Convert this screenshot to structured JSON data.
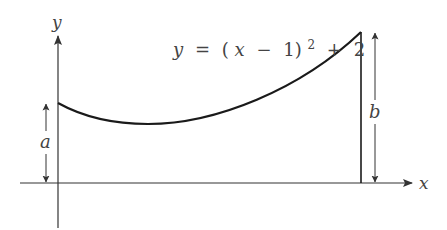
{
  "figure": {
    "equation": {
      "lhs": "y",
      "eq": "=",
      "open": "(",
      "var": "x",
      "minus": "−",
      "one": "1)",
      "exp": "2",
      "plus": "+",
      "const": "2"
    },
    "axes": {
      "x_label": "x",
      "y_label": "y"
    },
    "dimensions": {
      "a_label": "a",
      "b_label": "b"
    },
    "colors": {
      "curve": "#1a1a1a",
      "axis": "#333333",
      "text": "#444444",
      "background": "#ffffff"
    }
  }
}
